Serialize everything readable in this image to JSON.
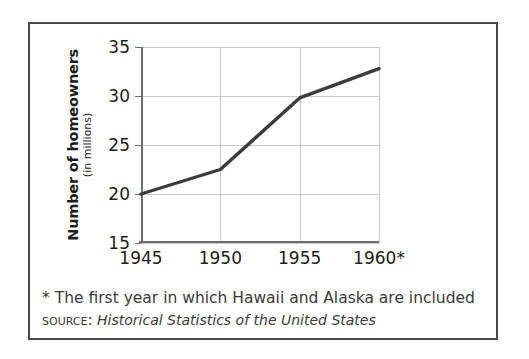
{
  "chart_data": {
    "type": "line",
    "title": "",
    "xlabel": "",
    "ylabel": "Number of homeowners",
    "ylabel_sub": "(in millions)",
    "x": [
      1945,
      1950,
      1955,
      1960
    ],
    "categories": [
      "1945",
      "1950",
      "1955",
      "1960*"
    ],
    "values": [
      20.0,
      22.5,
      29.8,
      32.8
    ],
    "series": [
      {
        "name": "Number of homeowners (in millions)",
        "values": [
          20.0,
          22.5,
          29.8,
          32.8
        ]
      }
    ],
    "xlim": [
      1945,
      1960
    ],
    "ylim": [
      15,
      35
    ],
    "y_ticks": [
      "35",
      "30",
      "25",
      "20",
      "15"
    ],
    "y_tick_values": [
      35,
      30,
      25,
      20,
      15
    ],
    "x_ticks": [
      "1945",
      "1950",
      "1955",
      "1960*"
    ],
    "grid": true,
    "legend": "none",
    "line_color": "#3c3c3c",
    "grid_color": "#c9c9c9",
    "axis_color": "#6e6e6e"
  },
  "figure": {
    "border_color": "#4a4a4a",
    "background": "#ffffff"
  },
  "footnote": {
    "asterisk_note": "* The first year in which Hawaii and Alaska are included",
    "source_label": "Source:",
    "source_title": "Historical Statistics of the United States"
  }
}
